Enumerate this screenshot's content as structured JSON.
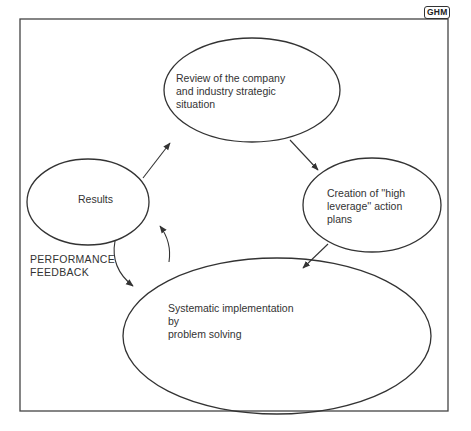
{
  "badge": {
    "text": "GHM"
  },
  "nodes": {
    "review": {
      "label": "Review of the company\nand industry strategic\nsituation"
    },
    "creation": {
      "label": "Creation of ''high\nleverage'' action\nplans"
    },
    "implementation": {
      "label": "Systematic implementation\nby\nproblem solving"
    },
    "results": {
      "label": "Results"
    }
  },
  "annotations": {
    "feedback": {
      "label": "PERFORMANCE\nFEEDBACK"
    }
  },
  "edges": [
    {
      "from": "results",
      "to": "review"
    },
    {
      "from": "review",
      "to": "creation"
    },
    {
      "from": "creation",
      "to": "implementation"
    },
    {
      "from": "implementation",
      "to": "results"
    },
    {
      "from": "results",
      "to": "implementation",
      "label": "PERFORMANCE FEEDBACK"
    }
  ],
  "colors": {
    "stroke": "#333333",
    "background": "#ffffff"
  }
}
